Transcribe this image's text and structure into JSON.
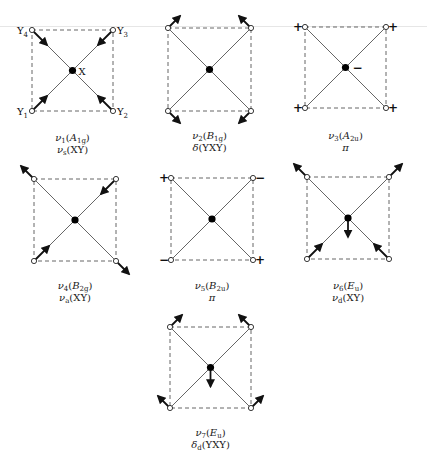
{
  "header": {
    "page_number": "546",
    "running_title": "DESIGN AND MOLECULES"
  },
  "molecule_labels": {
    "center": "X",
    "Y1": "Y",
    "Y1_sub": "1",
    "Y2": "Y",
    "Y2_sub": "2",
    "Y3": "Y",
    "Y3_sub": "3",
    "Y4": "Y",
    "Y4_sub": "4"
  },
  "modes": [
    {
      "id": "v1",
      "nu": "ν",
      "nu_sub": "1",
      "sym": "A",
      "sym_sub": "1g",
      "line2_sym": "ν",
      "line2_sub": "s",
      "line2_text": "(XY)",
      "type": "arrows",
      "corner_arrows": [
        "in",
        "in",
        "in",
        "in"
      ],
      "center_arrow": "none"
    },
    {
      "id": "v2",
      "nu": "ν",
      "nu_sub": "2",
      "sym": "B",
      "sym_sub": "1g",
      "line2_sym": "δ",
      "line2_sub": "",
      "line2_text": "(YXY)",
      "type": "arrows",
      "corner_arrows": [
        "ccw",
        "cw",
        "ccw",
        "cw"
      ],
      "center_arrow": "none"
    },
    {
      "id": "v3",
      "nu": "ν",
      "nu_sub": "3",
      "sym": "A",
      "sym_sub": "2u",
      "line2_sym": "π",
      "line2_sub": "",
      "line2_text": "",
      "type": "signs",
      "corner_signs": [
        "+",
        "+",
        "+",
        "+"
      ],
      "center_sign": "−"
    },
    {
      "id": "v4",
      "nu": "ν",
      "nu_sub": "4",
      "sym": "B",
      "sym_sub": "2g",
      "line2_sym": "ν",
      "line2_sub": "a",
      "line2_text": "(XY)",
      "type": "arrows",
      "corner_arrows": [
        "out",
        "in",
        "in",
        "out"
      ],
      "center_arrow": "none"
    },
    {
      "id": "v5",
      "nu": "ν",
      "nu_sub": "5",
      "sym": "B",
      "sym_sub": "2u",
      "line2_sym": "π",
      "line2_sub": "",
      "line2_text": "",
      "type": "signs",
      "corner_signs": [
        "+",
        "−",
        "−",
        "+"
      ],
      "center_sign": ""
    },
    {
      "id": "v6",
      "nu": "ν",
      "nu_sub": "6",
      "sym": "E",
      "sym_sub": "u",
      "line2_sym": "ν",
      "line2_sub": "d",
      "line2_text": "(XY)",
      "type": "arrows",
      "corner_arrows": [
        "out",
        "out",
        "in",
        "in"
      ],
      "center_arrow": "down"
    },
    {
      "id": "v7",
      "nu": "ν",
      "nu_sub": "7",
      "sym": "E",
      "sym_sub": "u",
      "line2_sym": "δ",
      "line2_sub": "d",
      "line2_text": "(YXY)",
      "type": "arrows",
      "corner_arrows": [
        "up-right",
        "up-left",
        "up-left",
        "up-right"
      ],
      "center_arrow": "down"
    }
  ]
}
